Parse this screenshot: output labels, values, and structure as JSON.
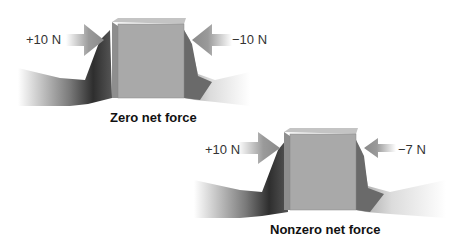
{
  "panels": [
    {
      "caption": "Zero net force",
      "left_force": "+10 N",
      "right_force": "−10 N"
    },
    {
      "caption": "Nonzero net force",
      "left_force": "+10 N",
      "right_force": "−7 N"
    }
  ],
  "colors": {
    "box_front": "#a9a9a9",
    "box_side": "#8e8e8e",
    "box_top": "#c4c4c4",
    "arrow": "#8a8a8a",
    "hand": "#6e6e6e"
  }
}
